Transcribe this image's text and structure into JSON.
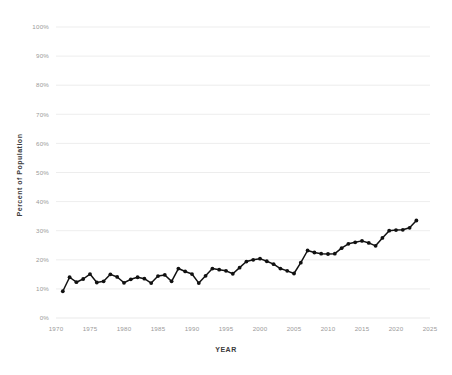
{
  "chart_data": {
    "type": "line",
    "title": "",
    "subtitle": "",
    "xlabel": "YEAR",
    "ylabel": "Percent of Population",
    "xlim": [
      1970,
      2025
    ],
    "ylim": [
      0,
      100
    ],
    "grid": true,
    "legend_position": "none",
    "y_tick_labels": [
      "0%",
      "10%",
      "20%",
      "30%",
      "40%",
      "50%",
      "60%",
      "70%",
      "80%",
      "90%",
      "100%"
    ],
    "y_tick_values": [
      0,
      10,
      20,
      30,
      40,
      50,
      60,
      70,
      80,
      90,
      100
    ],
    "x_tick_labels": [
      "1970",
      "1975",
      "1980",
      "1985",
      "1990",
      "1995",
      "2000",
      "2005",
      "2010",
      "2015",
      "2020",
      "2025"
    ],
    "x_tick_values": [
      1970,
      1975,
      1980,
      1985,
      1990,
      1995,
      2000,
      2005,
      2010,
      2015,
      2020,
      2025
    ],
    "series": [
      {
        "name": "Percent of Population",
        "color": "#111111",
        "marker": "circle",
        "x": [
          1971,
          1972,
          1973,
          1974,
          1975,
          1976,
          1977,
          1978,
          1979,
          1980,
          1981,
          1982,
          1983,
          1984,
          1985,
          1986,
          1987,
          1988,
          1989,
          1990,
          1991,
          1992,
          1993,
          1994,
          1995,
          1996,
          1997,
          1998,
          1999,
          2000,
          2001,
          2002,
          2003,
          2004,
          2005,
          2006,
          2007,
          2008,
          2009,
          2010,
          2011,
          2012,
          2013,
          2014,
          2015,
          2016,
          2017,
          2018,
          2019,
          2020,
          2021,
          2022,
          2023
        ],
        "values": [
          9.2,
          14.0,
          12.3,
          13.4,
          15.1,
          12.2,
          12.6,
          15.0,
          14.1,
          12.1,
          13.3,
          14.0,
          13.5,
          12.0,
          14.4,
          14.8,
          12.6,
          17.0,
          16.0,
          15.1,
          12.0,
          14.5,
          17.0,
          16.6,
          16.2,
          15.2,
          17.3,
          19.4,
          20.0,
          20.4,
          19.5,
          18.5,
          17.0,
          16.2,
          15.3,
          19.0,
          23.2,
          22.5,
          22.1,
          22.0,
          22.1,
          24.0,
          25.5,
          26.0,
          26.5,
          25.8,
          24.8,
          27.5,
          30.0,
          30.2,
          30.3,
          31.0,
          33.5
        ]
      }
    ]
  }
}
